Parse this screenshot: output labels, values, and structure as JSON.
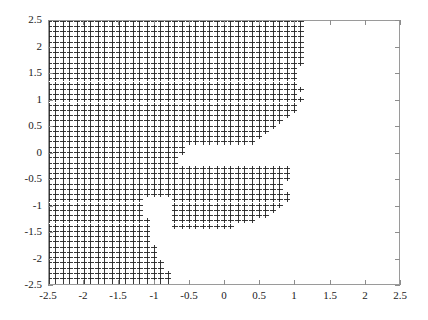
{
  "chart_data": {
    "type": "scatter",
    "title": "",
    "xlabel": "",
    "ylabel": "",
    "xlim": [
      -2.5,
      2.5
    ],
    "ylim": [
      -2.5,
      2.5
    ],
    "grid": false,
    "legend": null,
    "marker": "plus",
    "marker_color": "#222222",
    "point_spacing": 0.1,
    "x_ticks": [
      -2.5,
      -2,
      -1.5,
      -1,
      -0.5,
      0,
      0.5,
      1,
      1.5,
      2,
      2.5
    ],
    "y_ticks": [
      -2.5,
      -2,
      -1.5,
      -1,
      -0.5,
      0,
      0.5,
      1,
      1.5,
      2,
      2.5
    ],
    "x_tick_labels": [
      "-2.5",
      "-2",
      "-1.5",
      "-1",
      "-0.5",
      "0",
      "0.5",
      "1",
      "1.5",
      "2",
      "2.5"
    ],
    "y_tick_labels": [
      "-2.5",
      "-2",
      "-1.5",
      "-1",
      "-0.5",
      "0",
      "0.5",
      "1",
      "1.5",
      "2",
      "2.5"
    ],
    "boundary_by_row": [
      {
        "y": 2.5,
        "xmax": 1.1
      },
      {
        "y": 2.4,
        "xmax": 1.1
      },
      {
        "y": 2.3,
        "xmax": 1.1
      },
      {
        "y": 2.2,
        "xmax": 1.1
      },
      {
        "y": 2.1,
        "xmax": 1.1
      },
      {
        "y": 2.0,
        "xmax": 1.1
      },
      {
        "y": 1.9,
        "xmax": 1.1
      },
      {
        "y": 1.8,
        "xmax": 1.1
      },
      {
        "y": 1.7,
        "xmax": 1.1
      },
      {
        "y": 1.6,
        "xmax": 1.0
      },
      {
        "y": 1.5,
        "xmax": 1.0
      },
      {
        "y": 1.4,
        "xmax": 1.0
      },
      {
        "y": 1.3,
        "xmax": 1.0
      },
      {
        "y": 1.2,
        "xmax": 1.1
      },
      {
        "y": 1.1,
        "xmax": 1.0
      },
      {
        "y": 1.0,
        "xmax": 1.1
      },
      {
        "y": 0.9,
        "xmax": 0.9
      },
      {
        "y": 0.8,
        "xmax": 0.8
      },
      {
        "y": 0.7,
        "xmax": 0.7
      },
      {
        "y": 0.6,
        "xmax": 0.7
      },
      {
        "y": 0.5,
        "xmax": 0.6
      },
      {
        "y": 0.4,
        "xmax": 0.6
      },
      {
        "y": 0.3,
        "xmax": 0.5
      },
      {
        "y": 0.2,
        "xmax": 0.4
      },
      {
        "y": 0.1,
        "xmax": -0.6
      },
      {
        "y": 0.0,
        "xmax": -0.6
      },
      {
        "y": -0.1,
        "xmax": -0.7
      },
      {
        "y": -0.2,
        "xmax": -0.7
      },
      {
        "y": -0.3,
        "xmax": 0.9
      },
      {
        "y": -0.4,
        "xmax": 0.9
      },
      {
        "y": -0.5,
        "xmax": 0.9
      },
      {
        "y": -0.6,
        "xmax": 0.8
      },
      {
        "y": -0.7,
        "xmax": 0.8
      },
      {
        "y": -0.8,
        "xmax": 0.8
      },
      {
        "y": -0.9,
        "xmax": -1.2
      },
      {
        "y": -1.0,
        "xmax": -1.2
      },
      {
        "y": -1.1,
        "xmax": -1.2
      },
      {
        "y": -1.2,
        "xmax": -1.2
      },
      {
        "y": -1.3,
        "xmax": -1.1
      },
      {
        "y": -1.4,
        "xmax": -1.1
      },
      {
        "y": -1.5,
        "xmax": -1.1
      },
      {
        "y": -1.6,
        "xmax": -1.1
      },
      {
        "y": -1.7,
        "xmax": -1.1
      },
      {
        "y": -1.8,
        "xmax": -1.0
      },
      {
        "y": -1.9,
        "xmax": -1.0
      },
      {
        "y": -2.0,
        "xmax": -1.0
      },
      {
        "y": -2.1,
        "xmax": -0.9
      },
      {
        "y": -2.2,
        "xmax": -0.9
      },
      {
        "y": -2.3,
        "xmax": -0.8
      },
      {
        "y": -2.4,
        "xmax": -0.8
      },
      {
        "y": -2.5,
        "xmax": -0.8
      }
    ],
    "lobes": [
      {
        "name": "upper-right-lobe",
        "x_range": [
          -0.6,
          1.1
        ],
        "y_range": [
          0.2,
          1.7
        ]
      },
      {
        "name": "lower-right-lobe",
        "x_range": [
          -0.7,
          0.95
        ],
        "y_range": [
          -1.45,
          -0.25
        ]
      }
    ]
  }
}
